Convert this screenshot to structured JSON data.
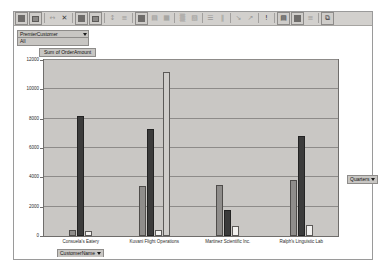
{
  "toolbar": {
    "buttons": [
      {
        "name": "pivot-table-wizard-icon",
        "glyph": "block"
      },
      {
        "name": "pivot-table-field-icon",
        "glyph": "block2"
      },
      {
        "name": "ungroup-icon",
        "glyph": "←→"
      },
      {
        "name": "hide-detail-icon",
        "glyph": "✕"
      },
      {
        "name": "show-detail-icon",
        "glyph": "block"
      },
      {
        "name": "refresh-data-icon",
        "glyph": "block2"
      },
      {
        "name": "include-hidden-items-icon",
        "glyph": "↕"
      },
      {
        "name": "field-settings-icon",
        "glyph": "≡"
      },
      {
        "name": "chart-wizard-icon",
        "glyph": "block"
      },
      {
        "name": "format-object-icon",
        "glyph": "▤"
      },
      {
        "name": "chart-type-icon",
        "glyph": "▦"
      },
      {
        "name": "legend-icon",
        "glyph": "▒"
      },
      {
        "name": "data-table-icon",
        "glyph": "▧"
      },
      {
        "name": "by-row-icon",
        "glyph": "☰"
      },
      {
        "name": "by-column-icon",
        "glyph": "‖"
      },
      {
        "name": "angle-text-down-icon",
        "glyph": "↘"
      },
      {
        "name": "angle-text-up-icon",
        "glyph": "↗"
      },
      {
        "name": "exclamation-icon",
        "glyph": "!"
      },
      {
        "name": "group-icon",
        "glyph": "▤"
      },
      {
        "name": "outline-icon",
        "glyph": "▦"
      },
      {
        "name": "subtotal-icon",
        "glyph": "≡"
      },
      {
        "name": "new-window-icon",
        "glyph": "⧉"
      }
    ]
  },
  "page_field": {
    "name_label": "PremierCustomer",
    "value_label": "All"
  },
  "customer_field_button": {
    "label": "CustomerName"
  },
  "quarters_field_button": {
    "label": "Quarters"
  },
  "chart_data": {
    "type": "bar",
    "title": "Sum of OrderAmount",
    "xlabel": "CustomerName",
    "ylabel": "",
    "ylim": [
      0,
      12000
    ],
    "yticks": [
      0,
      2000,
      4000,
      6000,
      8000,
      10000,
      12000
    ],
    "ytick_labels": [
      "0",
      "2000",
      "4000",
      "6000",
      "8000",
      "10000",
      "12000"
    ],
    "grid": true,
    "legend": "none",
    "legend_position": "hidden",
    "categories": [
      "Consuela's Eatery",
      "Kuvani Flight Operations",
      "Martinez Scientific Inc.",
      "Ralph's Linguistic Lab"
    ],
    "series": [
      {
        "name": "Qtr1",
        "color": "#8f8d8b",
        "values": [
          420,
          3400,
          3500,
          3800
        ]
      },
      {
        "name": "Qtr2",
        "color": "#3b3b3b",
        "values": [
          8200,
          7300,
          1800,
          6800
        ]
      },
      {
        "name": "Qtr3",
        "color": "#f2f1ef",
        "values": [
          350,
          400,
          700,
          750
        ]
      },
      {
        "name": "Qtr4",
        "color": "#cfcdca",
        "values": [
          0,
          11200,
          0,
          0
        ]
      }
    ]
  }
}
